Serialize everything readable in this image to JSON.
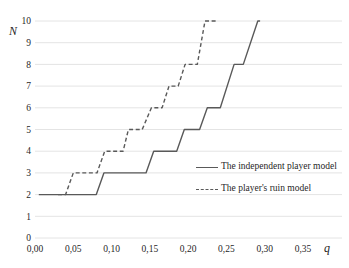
{
  "chart_data": {
    "type": "line",
    "title": "",
    "xlabel": "q",
    "ylabel": "N",
    "xlim": [
      0,
      0.35
    ],
    "ylim": [
      0,
      10
    ],
    "grid": "horizontal-only",
    "legend_position": "inside-right-middle",
    "x_ticks": [
      {
        "value": 0.0,
        "label": "0,00"
      },
      {
        "value": 0.05,
        "label": "0,05"
      },
      {
        "value": 0.1,
        "label": "0,10"
      },
      {
        "value": 0.15,
        "label": "0,15"
      },
      {
        "value": 0.2,
        "label": "0,20"
      },
      {
        "value": 0.25,
        "label": "0,25"
      },
      {
        "value": 0.3,
        "label": "0,30"
      },
      {
        "value": 0.35,
        "label": "0,35"
      }
    ],
    "y_ticks": [
      {
        "value": 0,
        "label": "0"
      },
      {
        "value": 1,
        "label": "1"
      },
      {
        "value": 2,
        "label": "2"
      },
      {
        "value": 3,
        "label": "3"
      },
      {
        "value": 4,
        "label": "4"
      },
      {
        "value": 5,
        "label": "5"
      },
      {
        "value": 6,
        "label": "6"
      },
      {
        "value": 7,
        "label": "7"
      },
      {
        "value": 8,
        "label": "8"
      },
      {
        "value": 9,
        "label": "9"
      },
      {
        "value": 10,
        "label": "10"
      }
    ],
    "series": [
      {
        "name": "The independent player model",
        "style": "solid",
        "color": "#595959",
        "points": [
          [
            0.005,
            2
          ],
          [
            0.08,
            2
          ],
          [
            0.09,
            3
          ],
          [
            0.145,
            3
          ],
          [
            0.155,
            4
          ],
          [
            0.185,
            4
          ],
          [
            0.195,
            5
          ],
          [
            0.215,
            5
          ],
          [
            0.225,
            6
          ],
          [
            0.242,
            6
          ],
          [
            0.26,
            8
          ],
          [
            0.272,
            8
          ],
          [
            0.291,
            10
          ],
          [
            0.294,
            10
          ]
        ]
      },
      {
        "name": "The player's ruin model",
        "style": "dashed",
        "color": "#595959",
        "points": [
          [
            0.03,
            2
          ],
          [
            0.04,
            2
          ],
          [
            0.05,
            3
          ],
          [
            0.081,
            3
          ],
          [
            0.091,
            4
          ],
          [
            0.115,
            4
          ],
          [
            0.122,
            5
          ],
          [
            0.14,
            5
          ],
          [
            0.152,
            6
          ],
          [
            0.166,
            6
          ],
          [
            0.175,
            7
          ],
          [
            0.187,
            7
          ],
          [
            0.196,
            8
          ],
          [
            0.212,
            8
          ],
          [
            0.222,
            10
          ],
          [
            0.237,
            10
          ]
        ]
      }
    ]
  },
  "axes": {
    "x_title": "q",
    "y_title": "N"
  },
  "legend": {
    "items": [
      {
        "label": "The independent player model",
        "marker": "solid-line"
      },
      {
        "label": "The player's ruin model",
        "marker": "dashed-line"
      }
    ]
  },
  "colors": {
    "line": "#595959",
    "grid": "#e4e4e4",
    "text": "#1f1f1f",
    "background": "#ffffff"
  }
}
